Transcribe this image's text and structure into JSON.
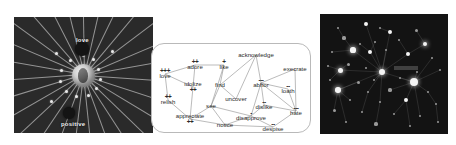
{
  "figure": {
    "background": "#ffffff",
    "panels": [
      "radial-graph",
      "word-lattice",
      "starfield-graph"
    ]
  },
  "left_panel": {
    "name": "radial-graph",
    "background": "#2a2a2a",
    "hub": {
      "label": ""
    },
    "labels": [
      {
        "text": "love",
        "x": 62,
        "y": 20
      },
      {
        "text": "positive",
        "x": 47,
        "y": 104
      }
    ],
    "dark_nodes": [
      {
        "x": 68,
        "y": 32,
        "r": 7
      },
      {
        "x": 55,
        "y": 96,
        "r": 6
      }
    ],
    "rays_deg": [
      4,
      18,
      31,
      44,
      57,
      70,
      84,
      97,
      110,
      124,
      137,
      150,
      163,
      176,
      190,
      203,
      216,
      229,
      243,
      256,
      269,
      283,
      296,
      310,
      323,
      337,
      350
    ],
    "satellites": [
      {
        "x": 56,
        "y": 43
      },
      {
        "x": 69,
        "y": 38
      },
      {
        "x": 79,
        "y": 42
      },
      {
        "x": 84,
        "y": 52
      },
      {
        "x": 86,
        "y": 62
      },
      {
        "x": 82,
        "y": 71
      },
      {
        "x": 74,
        "y": 78
      },
      {
        "x": 62,
        "y": 79
      },
      {
        "x": 52,
        "y": 74
      },
      {
        "x": 46,
        "y": 64
      },
      {
        "x": 47,
        "y": 53
      },
      {
        "x": 42,
        "y": 36
      },
      {
        "x": 37,
        "y": 84
      },
      {
        "x": 98,
        "y": 34
      }
    ]
  },
  "mid_panel": {
    "name": "word-lattice",
    "border_color": "#b9b9b9",
    "nodes": [
      {
        "id": "love",
        "word": "love",
        "sign": "+++",
        "sign_pos": "above",
        "x": 14,
        "y": 31
      },
      {
        "id": "adore",
        "word": "adore",
        "sign": "++",
        "sign_pos": "above",
        "x": 44,
        "y": 22
      },
      {
        "id": "like",
        "word": "like",
        "sign": "+",
        "sign_pos": "above",
        "x": 73,
        "y": 22
      },
      {
        "id": "idolize",
        "word": "idolize",
        "sign": "++",
        "sign_pos": "below",
        "x": 42,
        "y": 44
      },
      {
        "id": "relish",
        "word": "relish",
        "sign": "++",
        "sign_pos": "above",
        "x": 17,
        "y": 57
      },
      {
        "id": "appreciate",
        "word": "appreciate",
        "sign": "++",
        "sign_pos": "below",
        "x": 39,
        "y": 76
      },
      {
        "id": "acknowledge",
        "word": "acknowledge",
        "sign": "",
        "sign_pos": "none",
        "x": 105,
        "y": 12
      },
      {
        "id": "find",
        "word": "find",
        "sign": "",
        "sign_pos": "none",
        "x": 69,
        "y": 42
      },
      {
        "id": "uncover",
        "word": "uncover",
        "sign": "",
        "sign_pos": "none",
        "x": 85,
        "y": 56
      },
      {
        "id": "see",
        "word": "see",
        "sign": "",
        "sign_pos": "none",
        "x": 60,
        "y": 63
      },
      {
        "id": "notice",
        "word": "notice",
        "sign": "",
        "sign_pos": "none",
        "x": 74,
        "y": 82
      },
      {
        "id": "execrate",
        "word": "execrate",
        "sign": "",
        "sign_pos": "none",
        "x": 144,
        "y": 26
      },
      {
        "id": "abhor",
        "word": "abhor",
        "sign": "---",
        "sign_pos": "above",
        "x": 110,
        "y": 40
      },
      {
        "id": "loath",
        "word": "loath",
        "sign": "--",
        "sign_pos": "above",
        "x": 137,
        "y": 46
      },
      {
        "id": "dislike",
        "word": "dislike",
        "sign": "--",
        "sign_pos": "above",
        "x": 113,
        "y": 62
      },
      {
        "id": "hate",
        "word": "hate",
        "sign": "---",
        "sign_pos": "above",
        "x": 145,
        "y": 68
      },
      {
        "id": "disapprove",
        "word": "disapprove",
        "sign": "-",
        "sign_pos": "above",
        "x": 100,
        "y": 73
      },
      {
        "id": "despise",
        "word": "despise",
        "sign": "--",
        "sign_pos": "above",
        "x": 122,
        "y": 84
      }
    ],
    "edges": [
      [
        "love",
        "adore"
      ],
      [
        "love",
        "idolize"
      ],
      [
        "love",
        "relish"
      ],
      [
        "adore",
        "like"
      ],
      [
        "adore",
        "idolize"
      ],
      [
        "like",
        "find"
      ],
      [
        "like",
        "see"
      ],
      [
        "idolize",
        "appreciate"
      ],
      [
        "relish",
        "appreciate"
      ],
      [
        "appreciate",
        "see"
      ],
      [
        "appreciate",
        "notice"
      ],
      [
        "find",
        "see"
      ],
      [
        "find",
        "uncover"
      ],
      [
        "find",
        "acknowledge"
      ],
      [
        "see",
        "notice"
      ],
      [
        "see",
        "disapprove"
      ],
      [
        "uncover",
        "acknowledge"
      ],
      [
        "acknowledge",
        "abhor"
      ],
      [
        "execrate",
        "abhor"
      ],
      [
        "execrate",
        "hate"
      ],
      [
        "abhor",
        "loath"
      ],
      [
        "abhor",
        "dislike"
      ],
      [
        "abhor",
        "disapprove"
      ],
      [
        "abhor",
        "hate"
      ],
      [
        "loath",
        "hate"
      ],
      [
        "dislike",
        "hate"
      ],
      [
        "dislike",
        "disapprove"
      ],
      [
        "disapprove",
        "notice"
      ],
      [
        "disapprove",
        "despise"
      ],
      [
        "despise",
        "hate"
      ],
      [
        "despise",
        "notice"
      ]
    ]
  },
  "right_panel": {
    "name": "starfield-graph",
    "background": "#131313",
    "highlight_label": {
      "text": "",
      "x": 74,
      "y": 52
    },
    "stars": [
      {
        "x": 18,
        "y": 14,
        "r": 1.3,
        "dim": true
      },
      {
        "x": 46,
        "y": 10,
        "r": 1.9,
        "dim": false
      },
      {
        "x": 60,
        "y": 14,
        "r": 1.1,
        "dim": true
      },
      {
        "x": 70,
        "y": 18,
        "r": 2.2,
        "dim": false
      },
      {
        "x": 96,
        "y": 16,
        "r": 1.5,
        "dim": true
      },
      {
        "x": 24,
        "y": 24,
        "r": 1.6,
        "dim": true
      },
      {
        "x": 40,
        "y": 30,
        "r": 1.2,
        "dim": true
      },
      {
        "x": 55,
        "y": 28,
        "r": 1.4,
        "dim": true
      },
      {
        "x": 79,
        "y": 26,
        "r": 1.1,
        "dim": true
      },
      {
        "x": 105,
        "y": 30,
        "r": 2.4,
        "dim": false
      },
      {
        "x": 12,
        "y": 38,
        "r": 1.2,
        "dim": true
      },
      {
        "x": 33,
        "y": 36,
        "r": 2.6,
        "dim": false
      },
      {
        "x": 50,
        "y": 38,
        "r": 2.0,
        "dim": false
      },
      {
        "x": 66,
        "y": 36,
        "r": 1.3,
        "dim": true
      },
      {
        "x": 88,
        "y": 40,
        "r": 2.1,
        "dim": false
      },
      {
        "x": 112,
        "y": 44,
        "r": 1.3,
        "dim": true
      },
      {
        "x": 8,
        "y": 52,
        "r": 1.2,
        "dim": true
      },
      {
        "x": 28,
        "y": 50,
        "r": 1.5,
        "dim": true
      },
      {
        "x": 20,
        "y": 56,
        "r": 2.5,
        "dim": false
      },
      {
        "x": 46,
        "y": 54,
        "r": 1.3,
        "dim": true
      },
      {
        "x": 62,
        "y": 58,
        "r": 3.0,
        "dim": false
      },
      {
        "x": 97,
        "y": 58,
        "r": 1.4,
        "dim": true
      },
      {
        "x": 120,
        "y": 56,
        "r": 1.2,
        "dim": true
      },
      {
        "x": 10,
        "y": 66,
        "r": 1.2,
        "dim": true
      },
      {
        "x": 38,
        "y": 68,
        "r": 1.5,
        "dim": true
      },
      {
        "x": 54,
        "y": 66,
        "r": 1.2,
        "dim": true
      },
      {
        "x": 80,
        "y": 64,
        "r": 1.3,
        "dim": true
      },
      {
        "x": 94,
        "y": 68,
        "r": 4.0,
        "dim": false
      },
      {
        "x": 18,
        "y": 76,
        "r": 2.7,
        "dim": false
      },
      {
        "x": 48,
        "y": 78,
        "r": 1.2,
        "dim": true
      },
      {
        "x": 70,
        "y": 76,
        "r": 1.6,
        "dim": true
      },
      {
        "x": 108,
        "y": 78,
        "r": 1.4,
        "dim": true
      },
      {
        "x": 30,
        "y": 86,
        "r": 1.3,
        "dim": true
      },
      {
        "x": 60,
        "y": 88,
        "r": 1.2,
        "dim": true
      },
      {
        "x": 86,
        "y": 86,
        "r": 1.9,
        "dim": false
      },
      {
        "x": 116,
        "y": 90,
        "r": 1.2,
        "dim": true
      },
      {
        "x": 14,
        "y": 96,
        "r": 1.5,
        "dim": true
      },
      {
        "x": 42,
        "y": 98,
        "r": 1.3,
        "dim": true
      },
      {
        "x": 74,
        "y": 100,
        "r": 1.2,
        "dim": true
      },
      {
        "x": 100,
        "y": 102,
        "r": 1.4,
        "dim": true
      },
      {
        "x": 26,
        "y": 108,
        "r": 1.2,
        "dim": true
      },
      {
        "x": 56,
        "y": 110,
        "r": 1.6,
        "dim": true
      },
      {
        "x": 90,
        "y": 112,
        "r": 1.2,
        "dim": true
      },
      {
        "x": 118,
        "y": 108,
        "r": 1.3,
        "dim": true
      }
    ],
    "edges": [
      [
        46,
        10,
        62,
        58
      ],
      [
        70,
        18,
        62,
        58
      ],
      [
        33,
        36,
        62,
        58
      ],
      [
        50,
        38,
        62,
        58
      ],
      [
        88,
        40,
        62,
        58
      ],
      [
        94,
        68,
        62,
        58
      ],
      [
        20,
        56,
        62,
        58
      ],
      [
        18,
        76,
        62,
        58
      ],
      [
        105,
        30,
        88,
        40
      ],
      [
        112,
        44,
        94,
        68
      ],
      [
        86,
        86,
        94,
        68
      ],
      [
        108,
        78,
        94,
        68
      ],
      [
        24,
        24,
        33,
        36
      ],
      [
        40,
        30,
        50,
        38
      ],
      [
        55,
        28,
        50,
        38
      ],
      [
        28,
        50,
        20,
        56
      ],
      [
        38,
        68,
        18,
        76
      ],
      [
        48,
        78,
        62,
        58
      ],
      [
        60,
        88,
        62,
        58
      ],
      [
        70,
        76,
        94,
        68
      ],
      [
        8,
        52,
        20,
        56
      ],
      [
        12,
        38,
        33,
        36
      ],
      [
        96,
        16,
        105,
        30
      ],
      [
        79,
        26,
        88,
        40
      ],
      [
        120,
        56,
        94,
        68
      ],
      [
        14,
        96,
        18,
        76
      ],
      [
        42,
        98,
        48,
        78
      ],
      [
        56,
        110,
        60,
        88
      ],
      [
        74,
        100,
        86,
        86
      ],
      [
        100,
        102,
        94,
        68
      ],
      [
        26,
        108,
        18,
        76
      ],
      [
        116,
        90,
        108,
        78
      ],
      [
        90,
        112,
        86,
        86
      ],
      [
        118,
        108,
        116,
        90
      ],
      [
        66,
        36,
        62,
        58
      ],
      [
        97,
        58,
        94,
        68
      ],
      [
        54,
        66,
        62,
        58
      ],
      [
        80,
        64,
        94,
        68
      ],
      [
        30,
        86,
        18,
        76
      ],
      [
        10,
        66,
        20,
        56
      ],
      [
        18,
        14,
        24,
        24
      ],
      [
        60,
        14,
        70,
        18
      ]
    ]
  }
}
